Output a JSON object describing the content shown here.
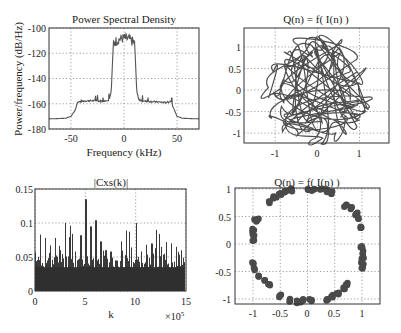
{
  "chart_data": [
    {
      "type": "line",
      "title": "Power Spectral Density",
      "xlabel": "Frequency (kHz)",
      "ylabel": "Power/frequency (dB/Hz)",
      "xlim": [
        -70.7,
        70.7
      ],
      "ylim": [
        -180,
        -100
      ],
      "xticks": [
        -50,
        0,
        50
      ],
      "yticks": [
        -100,
        -120,
        -140,
        -160,
        -180
      ],
      "grid": true,
      "x": [
        -70.7,
        -55,
        -50,
        -46,
        -44,
        -40,
        -30,
        -20,
        -14,
        -12,
        -11,
        -10,
        -5,
        0,
        5,
        10,
        11,
        12,
        14,
        20,
        30,
        40,
        44,
        46,
        50,
        55,
        70.7
      ],
      "values": [
        -172,
        -171.5,
        -170,
        -165,
        -159,
        -158,
        -157.5,
        -158,
        -157,
        -150,
        -130,
        -112,
        -109,
        -108,
        -109,
        -112,
        -130,
        -150,
        -157,
        -158,
        -158.5,
        -159,
        -158,
        -162,
        -170,
        -171.5,
        -172
      ]
    },
    {
      "type": "line",
      "title": "Q(n) = f( I(n) )",
      "xlabel": "",
      "ylabel": "",
      "xlim": [
        -1.74,
        1.7
      ],
      "ylim": [
        -1.23,
        1.44
      ],
      "xticks": [
        -1,
        0,
        1
      ],
      "yticks": [
        1,
        0.5,
        0,
        -0.5,
        -1
      ],
      "grid": true,
      "description": "Dense tangle of looping trajectory traces filling roughly the square [-1.4,1.4]x[-1.2,1.4]"
    },
    {
      "type": "bar",
      "title": "|Cxs(k)|",
      "xlabel": "k",
      "ylabel": "",
      "x_multiplier": "×10^5",
      "xlim": [
        0,
        15
      ],
      "ylim": [
        0,
        0.15
      ],
      "xticks": [
        0,
        5,
        10,
        15
      ],
      "yticks": [
        0,
        0.05,
        0.1,
        0.15
      ],
      "grid": true,
      "x": [
        0,
        0.5,
        1,
        1.5,
        2,
        2.5,
        3,
        3.5,
        4,
        4.5,
        5,
        5.5,
        6,
        6.5,
        7,
        7.5,
        8,
        8.5,
        9,
        9.5,
        10,
        10.5,
        11,
        11.5,
        12,
        12.5,
        13,
        13.5,
        14,
        14.5
      ],
      "values": [
        0.057,
        0.083,
        0.078,
        0.067,
        0.078,
        0.06,
        0.1,
        0.096,
        0.058,
        0.082,
        0.135,
        0.095,
        0.104,
        0.073,
        0.06,
        0.058,
        0.045,
        0.073,
        0.089,
        0.064,
        0.1,
        0.058,
        0.068,
        0.07,
        0.09,
        0.065,
        0.072,
        0.07,
        0.065,
        0.06
      ]
    },
    {
      "type": "scatter",
      "title": "Q(n) = f( I(n) )",
      "xlabel": "",
      "ylabel": "",
      "xlim": [
        -1.15,
        1.5
      ],
      "ylim": [
        -1.09,
        1.02
      ],
      "xticks": [
        -1,
        -0.5,
        0,
        0.5,
        1
      ],
      "yticks": [
        1,
        0.5,
        0,
        -0.5,
        -1
      ],
      "grid": true,
      "description": "Points lying near the unit circle, clustered in arcs",
      "points": [
        [
          -0.7,
          0.75
        ],
        [
          -0.6,
          0.85
        ],
        [
          -0.5,
          0.9
        ],
        [
          -0.4,
          0.95
        ],
        [
          -0.3,
          0.98
        ],
        [
          0,
          0.97
        ],
        [
          0.1,
          0.99
        ],
        [
          0.25,
          1.0
        ],
        [
          0.35,
          0.97
        ],
        [
          0.45,
          0.93
        ],
        [
          0.7,
          0.7
        ],
        [
          0.8,
          0.65
        ],
        [
          0.9,
          0.55
        ],
        [
          0.95,
          0.45
        ],
        [
          1.0,
          0.3
        ],
        [
          1.0,
          -0.05
        ],
        [
          1.02,
          -0.15
        ],
        [
          1.02,
          -0.25
        ],
        [
          1.0,
          -0.35
        ],
        [
          1.0,
          -0.43
        ],
        [
          0.72,
          -0.73
        ],
        [
          0.68,
          -0.8
        ],
        [
          0.55,
          -0.9
        ],
        [
          0.45,
          -0.95
        ],
        [
          0.35,
          -1.0
        ],
        [
          0.05,
          -1.02
        ],
        [
          -0.1,
          -1.03
        ],
        [
          -0.2,
          -1.05
        ],
        [
          -0.35,
          -1.02
        ],
        [
          -0.5,
          -0.95
        ],
        [
          -0.7,
          -0.75
        ],
        [
          -0.8,
          -0.68
        ],
        [
          -0.9,
          -0.58
        ],
        [
          -0.98,
          -0.45
        ],
        [
          -1.0,
          -0.35
        ],
        [
          -1.0,
          0.05
        ],
        [
          -0.98,
          0.15
        ],
        [
          -1.0,
          0.25
        ],
        [
          -0.95,
          0.42
        ],
        [
          -0.92,
          0.45
        ]
      ]
    }
  ],
  "panels": {
    "psd": {
      "title": "Power Spectral Density",
      "xlabel": "Frequency (kHz)",
      "ylabel": "Power/frequency (dB/Hz)",
      "xticks": [
        "-50",
        "0",
        "50"
      ],
      "yticks": [
        "-100",
        "-120",
        "-140",
        "-160",
        "-180"
      ]
    },
    "iq_trace": {
      "title": "Q(n) = f( I(n) )",
      "xticks": [
        "-1",
        "0",
        "1"
      ],
      "yticks": [
        "1",
        "0.5",
        "0",
        "-0.5",
        "-1"
      ]
    },
    "cxs": {
      "title": "|Cxs(k)|",
      "xlabel": "k",
      "multiplier": "×10",
      "multiplier_exp": "5",
      "xticks": [
        "0",
        "5",
        "10",
        "15"
      ],
      "yticks": [
        "0.15",
        "0.1",
        "0.05",
        "0"
      ]
    },
    "constellation": {
      "title": "Q(n) = f( I(n) )",
      "xticks": [
        "-1",
        "-0.5",
        "0",
        "0.5",
        "1"
      ],
      "yticks": [
        "1",
        "0.5",
        "0",
        "-0.5",
        "-1"
      ]
    }
  },
  "colors": {
    "line": "#555555",
    "bars": "#3a3a3a",
    "markers": "#4a4a4a",
    "trace": "#3c3c3c"
  }
}
